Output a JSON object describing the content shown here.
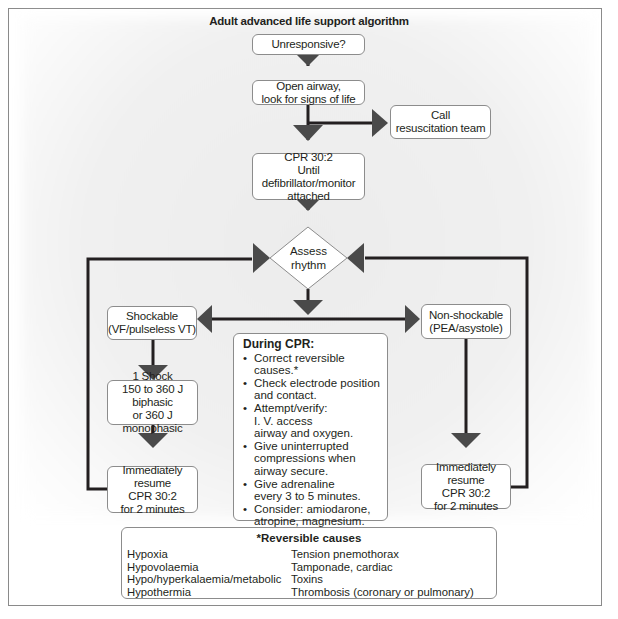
{
  "diagram": {
    "title": "Adult advanced life support algorithm",
    "nodes": {
      "unresponsive": "Unresponsive?",
      "open_airway": "Open airway,\nlook for signs of life",
      "call_team": "Call\nresuscitation team",
      "cpr_initial": "CPR 30:2\nUntil defibrillator/monitor\nattached",
      "assess": "Assess\nrhythm",
      "shockable": "Shockable\n(VF/pulseless VT)",
      "non_shockable": "Non-shockable\n(PEA/asystole)",
      "shock": "1 Shock\n150 to 360 J biphasic\nor 360 J monophasic",
      "resume_left": "Immediately resume\nCPR 30:2\nfor 2 minutes",
      "resume_right": "Immediately resume\nCPR 30:2\nfor 2 minutes"
    },
    "during_cpr": {
      "heading": "During CPR:",
      "items": [
        "Correct reversible causes.*",
        "Check electrode position\nand contact.",
        "Attempt/verify:\nI. V. access\nairway and oxygen.",
        "Give uninterrupted\ncompressions when\nairway secure.",
        "Give adrenaline\nevery 3 to 5 minutes.",
        "Consider: amiodarone,\natropine, magnesium."
      ]
    },
    "reversible_causes": {
      "heading": "*Reversible causes",
      "left": [
        "Hypoxia",
        "Hypovolaemia",
        "Hypo/hyperkalaemia/metabolic",
        "Hypothermia"
      ],
      "right": [
        "Tension pnemothorax",
        "Tamponade, cardiac",
        "Toxins",
        "Thrombosis (coronary or pulmonary)"
      ]
    },
    "colors": {
      "line": "#231f20",
      "arrow": "#4a4a4a",
      "box_border": "#8c8c8c",
      "background_shade": "#eeeeee"
    }
  }
}
